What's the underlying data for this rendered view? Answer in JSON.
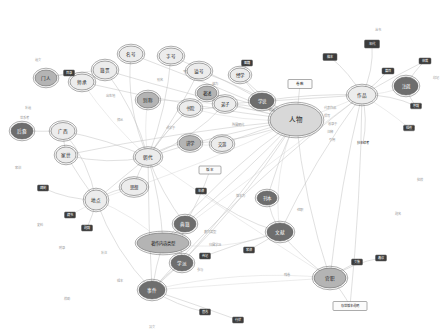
{
  "view": {
    "title": "Knowledge Graph Visualization",
    "background": "#ffffff",
    "width": 448,
    "height": 336,
    "edge_color": "#b9b9b9",
    "node_palette": {
      "hub_light": "#d8d8d8",
      "ellipse_light": "#ececec",
      "ellipse_mid": "#b4b4b4",
      "ellipse_dark": "#6e6e6e",
      "rect_dark": "#3c3c3c",
      "rect_light": "#fbfbfb",
      "stroke": "#5a5a5a",
      "label_dark": "#1e1e1e",
      "label_light": "#ffffff"
    }
  },
  "legend": {
    "graph_kind": "force-directed knowledge graph",
    "node_shapes": [
      "ellipse",
      "rectangle"
    ],
    "hub_count": 6
  },
  "nodes": [
    {
      "id": "n01",
      "label": "人物",
      "x": 296,
      "y": 120,
      "rx": 26,
      "ry": 16,
      "shape": "ellipse",
      "style": "hub_light",
      "fs": 6.5,
      "ring": true
    },
    {
      "id": "n02",
      "label": "作品",
      "x": 362,
      "y": 95,
      "rx": 14,
      "ry": 9,
      "shape": "ellipse",
      "style": "ellipse_light",
      "fs": 4.6,
      "ring": true
    },
    {
      "id": "n03",
      "label": "朝代",
      "x": 148,
      "y": 157,
      "rx": 13,
      "ry": 8.5,
      "shape": "ellipse",
      "style": "ellipse_light",
      "fs": 4.6,
      "ring": true
    },
    {
      "id": "n04",
      "label": "地点",
      "x": 96,
      "y": 200,
      "rx": 11,
      "ry": 10,
      "shape": "ellipse",
      "style": "ellipse_light",
      "fs": 4.6,
      "ring": true
    },
    {
      "id": "n05",
      "label": "事件",
      "x": 152,
      "y": 290,
      "rx": 13,
      "ry": 9,
      "shape": "ellipse",
      "style": "ellipse_dark",
      "fs": 4.6,
      "ring": true
    },
    {
      "id": "n06",
      "label": "官职",
      "x": 330,
      "y": 278,
      "rx": 16,
      "ry": 10,
      "shape": "ellipse",
      "style": "ellipse_mid",
      "fs": 4.6,
      "ring": true
    },
    {
      "id": "n07",
      "label": "文献",
      "x": 280,
      "y": 232,
      "rx": 13,
      "ry": 9,
      "shape": "ellipse",
      "style": "ellipse_dark",
      "fs": 4.6,
      "ring": true
    },
    {
      "id": "n08",
      "label": "典籍",
      "x": 185,
      "y": 224,
      "rx": 11,
      "ry": 8,
      "shape": "ellipse",
      "style": "ellipse_dark",
      "fs": 4.6,
      "ring": true
    },
    {
      "id": "n09",
      "label": "著作内容类型",
      "x": 163,
      "y": 243,
      "rx": 26,
      "ry": 10,
      "shape": "ellipse",
      "style": "ellipse_mid",
      "fs": 4.4,
      "ring": true
    },
    {
      "id": "n10",
      "label": "学派",
      "x": 182,
      "y": 263,
      "rx": 11,
      "ry": 8,
      "shape": "ellipse",
      "style": "ellipse_dark",
      "fs": 4.6,
      "ring": true
    },
    {
      "id": "n11",
      "label": "思想",
      "x": 134,
      "y": 187,
      "rx": 13,
      "ry": 8.5,
      "shape": "ellipse",
      "style": "ellipse_light",
      "fs": 4.4,
      "ring": true
    },
    {
      "id": "n12",
      "label": "籍贯",
      "x": 105,
      "y": 70,
      "rx": 12,
      "ry": 9,
      "shape": "ellipse",
      "style": "ellipse_light",
      "fs": 4.6,
      "ring": true
    },
    {
      "id": "n13",
      "label": "名号",
      "x": 131,
      "y": 54,
      "rx": 12,
      "ry": 8,
      "shape": "ellipse",
      "style": "ellipse_light",
      "fs": 4.6,
      "ring": true
    },
    {
      "id": "n14",
      "label": "字号",
      "x": 171,
      "y": 56,
      "rx": 12,
      "ry": 8,
      "shape": "ellipse",
      "style": "ellipse_light",
      "fs": 4.6,
      "ring": true
    },
    {
      "id": "n15",
      "label": "谥号",
      "x": 199,
      "y": 71,
      "rx": 12,
      "ry": 8,
      "shape": "ellipse",
      "style": "ellipse_light",
      "fs": 4.6,
      "ring": true
    },
    {
      "id": "n16",
      "label": "别称",
      "x": 148,
      "y": 100,
      "rx": 11,
      "ry": 8,
      "shape": "ellipse",
      "style": "ellipse_mid",
      "fs": 4.6,
      "ring": true
    },
    {
      "id": "n17",
      "label": "门人",
      "x": 46,
      "y": 78,
      "rx": 11,
      "ry": 8,
      "shape": "ellipse",
      "style": "ellipse_mid",
      "fs": 4.6,
      "ring": true
    },
    {
      "id": "n18",
      "label": "师承",
      "x": 82,
      "y": 82,
      "rx": 12,
      "ry": 8,
      "shape": "ellipse",
      "style": "ellipse_light",
      "fs": 4.6,
      "ring": true
    },
    {
      "id": "n19",
      "label": "家世",
      "x": 66,
      "y": 155,
      "rx": 10,
      "ry": 8,
      "shape": "ellipse",
      "style": "ellipse_light",
      "fs": 4.6,
      "ring": true
    },
    {
      "id": "n20",
      "label": "广西",
      "x": 63,
      "y": 131,
      "rx": 12,
      "ry": 8.5,
      "shape": "ellipse",
      "style": "ellipse_light",
      "fs": 4.6,
      "ring": true
    },
    {
      "id": "n21",
      "label": "后裔",
      "x": 22,
      "y": 131,
      "rx": 11,
      "ry": 8,
      "shape": "ellipse",
      "style": "ellipse_dark",
      "fs": 4.6,
      "ring": true
    },
    {
      "id": "n22",
      "label": "书院",
      "x": 190,
      "y": 108,
      "rx": 11,
      "ry": 7.5,
      "shape": "ellipse",
      "style": "ellipse_light",
      "fs": 4.4,
      "ring": true
    },
    {
      "id": "n23",
      "label": "讲学",
      "x": 190,
      "y": 143,
      "rx": 11,
      "ry": 7.5,
      "shape": "ellipse",
      "style": "ellipse_mid",
      "fs": 4.4,
      "ring": true
    },
    {
      "id": "n24",
      "label": "弟子",
      "x": 225,
      "y": 104,
      "rx": 11,
      "ry": 7.5,
      "shape": "ellipse",
      "style": "ellipse_light",
      "fs": 4.4,
      "ring": true
    },
    {
      "id": "n25",
      "label": "交游",
      "x": 222,
      "y": 144,
      "rx": 11,
      "ry": 7.5,
      "shape": "ellipse",
      "style": "ellipse_light",
      "fs": 4.4,
      "ring": true
    },
    {
      "id": "n26",
      "label": "学说",
      "x": 262,
      "y": 101,
      "rx": 12,
      "ry": 8,
      "shape": "ellipse",
      "style": "ellipse_dark",
      "fs": 4.4,
      "ring": true
    },
    {
      "id": "n27",
      "label": "著述",
      "x": 207,
      "y": 93,
      "rx": 10,
      "ry": 7,
      "shape": "ellipse",
      "style": "ellipse_mid",
      "fs": 4.4,
      "ring": true
    },
    {
      "id": "n28",
      "label": "经学",
      "x": 240,
      "y": 75,
      "rx": 10,
      "ry": 7,
      "shape": "ellipse",
      "style": "ellipse_light",
      "fs": 4.4,
      "ring": true
    },
    {
      "id": "n29",
      "label": "注疏",
      "x": 406,
      "y": 86,
      "rx": 12,
      "ry": 9,
      "shape": "ellipse",
      "style": "ellipse_dark",
      "fs": 4.4,
      "ring": true
    },
    {
      "id": "n30",
      "label": "刊本",
      "x": 267,
      "y": 198,
      "rx": 10,
      "ry": 7,
      "shape": "ellipse",
      "style": "ellipse_dark",
      "fs": 4.4,
      "ring": true
    },
    {
      "id": "r01",
      "label": "卷数",
      "x": 300,
      "y": 84,
      "w": 24,
      "h": 9,
      "shape": "rect",
      "style": "rect_light",
      "fs": 3.6
    },
    {
      "id": "r02",
      "label": "版本",
      "x": 210,
      "y": 170,
      "w": 22,
      "h": 8,
      "shape": "rect",
      "style": "rect_light",
      "fs": 3.6
    },
    {
      "id": "r03",
      "label": "年代",
      "x": 372,
      "y": 44,
      "w": 15,
      "h": 8,
      "shape": "rect",
      "style": "rect_dark",
      "fs": 3.4
    },
    {
      "id": "r04",
      "label": "篇目",
      "x": 388,
      "y": 71,
      "w": 12,
      "h": 6,
      "shape": "rect",
      "style": "rect_dark",
      "fs": 3.2
    },
    {
      "id": "r05",
      "label": "体裁",
      "x": 425,
      "y": 61,
      "w": 12,
      "h": 6,
      "shape": "rect",
      "style": "rect_dark",
      "fs": 3.2
    },
    {
      "id": "r06",
      "label": "序跋",
      "x": 416,
      "y": 106,
      "w": 11,
      "h": 5.5,
      "shape": "rect",
      "style": "rect_dark",
      "fs": 3.2
    },
    {
      "id": "r07",
      "label": "辑佚",
      "x": 409,
      "y": 128,
      "w": 11,
      "h": 5.5,
      "shape": "rect",
      "style": "rect_dark",
      "fs": 3.2
    },
    {
      "id": "r08",
      "label": "藏书",
      "x": 70,
      "y": 215,
      "w": 11,
      "h": 6,
      "shape": "rect",
      "style": "rect_dark",
      "fs": 3.2
    },
    {
      "id": "r09",
      "label": "碑刻",
      "x": 43,
      "y": 188,
      "w": 11,
      "h": 6,
      "shape": "rect",
      "style": "rect_dark",
      "fs": 3.2
    },
    {
      "id": "r10",
      "label": "题跋",
      "x": 87,
      "y": 228,
      "w": 11,
      "h": 6,
      "shape": "rect",
      "style": "rect_dark",
      "fs": 3.2
    },
    {
      "id": "r11",
      "label": "年谱",
      "x": 201,
      "y": 191,
      "w": 11,
      "h": 6,
      "shape": "rect",
      "style": "rect_dark",
      "fs": 3.2
    },
    {
      "id": "r12",
      "label": "传记",
      "x": 205,
      "y": 256,
      "w": 11,
      "h": 6,
      "shape": "rect",
      "style": "rect_dark",
      "fs": 3.2
    },
    {
      "id": "r13",
      "label": "家谱",
      "x": 249,
      "y": 250,
      "w": 11,
      "h": 6,
      "shape": "rect",
      "style": "rect_dark",
      "fs": 3.2
    },
    {
      "id": "r14",
      "label": "文集",
      "x": 357,
      "y": 262,
      "w": 11,
      "h": 6,
      "shape": "rect",
      "style": "rect_dark",
      "fs": 3.2
    },
    {
      "id": "r15",
      "label": "奏议",
      "x": 381,
      "y": 258,
      "w": 11,
      "h": 6,
      "shape": "rect",
      "style": "rect_dark",
      "fs": 3.2
    },
    {
      "id": "r16",
      "label": "墓志",
      "x": 205,
      "y": 312,
      "w": 11,
      "h": 6,
      "shape": "rect",
      "style": "rect_dark",
      "fs": 3.2
    },
    {
      "id": "r17",
      "label": "行状",
      "x": 238,
      "y": 320,
      "w": 11,
      "h": 6,
      "shape": "rect",
      "style": "rect_dark",
      "fs": 3.2
    },
    {
      "id": "r18",
      "label": "目录",
      "x": 69,
      "y": 73,
      "w": 11,
      "h": 6,
      "shape": "rect",
      "style": "rect_dark",
      "fs": 3.2
    },
    {
      "id": "r19",
      "label": "图籍",
      "x": 247,
      "y": 63,
      "w": 11,
      "h": 6,
      "shape": "rect",
      "style": "rect_dark",
      "fs": 3.2
    },
    {
      "id": "r20",
      "label": "稿本",
      "x": 330,
      "y": 57,
      "w": 14,
      "h": 7,
      "shape": "rect",
      "style": "rect_dark",
      "fs": 3.2
    },
    {
      "id": "r21",
      "label": "抄本续考",
      "x": 363,
      "y": 143,
      "w": 26,
      "h": 6,
      "shape": "rect",
      "style": "rect_none",
      "fs": 3.2
    },
    {
      "id": "r22",
      "label": "存世版本说明",
      "x": 350,
      "y": 306,
      "w": 34,
      "h": 9,
      "shape": "rect",
      "style": "rect_light",
      "fs": 3.2
    }
  ],
  "small_labels": [
    {
      "text": "遗文",
      "x": 38,
      "y": 60,
      "fs": 3.2
    },
    {
      "text": "补遗",
      "x": 28,
      "y": 108,
      "fs": 3.2
    },
    {
      "text": "世系考",
      "x": 24,
      "y": 118,
      "fs": 3.2
    },
    {
      "text": "家训",
      "x": 18,
      "y": 168,
      "fs": 3.2
    },
    {
      "text": "史料",
      "x": 40,
      "y": 225,
      "fs": 3.2
    },
    {
      "text": "附录",
      "x": 62,
      "y": 248,
      "fs": 3.2
    },
    {
      "text": "补注",
      "x": 104,
      "y": 253,
      "fs": 3.2
    },
    {
      "text": "辑本",
      "x": 120,
      "y": 281,
      "fs": 3.2
    },
    {
      "text": "校勘",
      "x": 67,
      "y": 299,
      "fs": 3.2
    },
    {
      "text": "异文",
      "x": 152,
      "y": 327,
      "fs": 3.2
    },
    {
      "text": "残卷",
      "x": 287,
      "y": 275,
      "fs": 3.2
    },
    {
      "text": "批校",
      "x": 420,
      "y": 180,
      "fs": 3.2
    },
    {
      "text": "题名",
      "x": 398,
      "y": 214,
      "fs": 3.2
    },
    {
      "text": "印记",
      "x": 436,
      "y": 78,
      "fs": 3.2
    },
    {
      "text": "丛书",
      "x": 378,
      "y": 30,
      "fs": 3.2
    }
  ],
  "edge_labels": [
    {
      "text": "所属朝代",
      "x": 238,
      "y": 125
    },
    {
      "text": "代表作品",
      "x": 330,
      "y": 108
    },
    {
      "text": "撰写",
      "x": 327,
      "y": 116
    },
    {
      "text": "收录于",
      "x": 332,
      "y": 124
    },
    {
      "text": "注释",
      "x": 330,
      "y": 132
    },
    {
      "text": "引用",
      "x": 332,
      "y": 140
    },
    {
      "text": "师从",
      "x": 120,
      "y": 120
    },
    {
      "text": "讲学于",
      "x": 170,
      "y": 128
    },
    {
      "text": "任职",
      "x": 300,
      "y": 210
    },
    {
      "text": "出生地",
      "x": 110,
      "y": 96
    },
    {
      "text": "参与",
      "x": 200,
      "y": 270
    },
    {
      "text": "版本为",
      "x": 240,
      "y": 196
    },
    {
      "text": "别名",
      "x": 160,
      "y": 80
    },
    {
      "text": "字为",
      "x": 186,
      "y": 72
    },
    {
      "text": "谥为",
      "x": 215,
      "y": 84
    },
    {
      "text": "归属学派",
      "x": 215,
      "y": 245
    },
    {
      "text": "著作类型",
      "x": 210,
      "y": 232
    },
    {
      "text": "提出",
      "x": 272,
      "y": 110
    }
  ],
  "edges": [
    [
      "n01",
      "n02"
    ],
    [
      "n01",
      "n03"
    ],
    [
      "n01",
      "n26"
    ],
    [
      "n01",
      "n24"
    ],
    [
      "n01",
      "n25"
    ],
    [
      "n01",
      "n22"
    ],
    [
      "n01",
      "n23"
    ],
    [
      "n01",
      "n27"
    ],
    [
      "n01",
      "n28"
    ],
    [
      "n01",
      "n06"
    ],
    [
      "n01",
      "n07"
    ],
    [
      "n01",
      "n05"
    ],
    [
      "n01",
      "n09"
    ],
    [
      "n01",
      "n10"
    ],
    [
      "n01",
      "n08"
    ],
    [
      "n01",
      "n04"
    ],
    [
      "n01",
      "n12"
    ],
    [
      "n01",
      "n13"
    ],
    [
      "n01",
      "n14"
    ],
    [
      "n01",
      "n15"
    ],
    [
      "n01",
      "n16"
    ],
    [
      "n01",
      "n18"
    ],
    [
      "n01",
      "n19"
    ],
    [
      "n01",
      "n30"
    ],
    [
      "n01",
      "r01"
    ],
    [
      "n02",
      "n29"
    ],
    [
      "n02",
      "r03"
    ],
    [
      "n02",
      "r04"
    ],
    [
      "n02",
      "r05"
    ],
    [
      "n02",
      "r06"
    ],
    [
      "n02",
      "r07"
    ],
    [
      "n02",
      "r20"
    ],
    [
      "n02",
      "r21"
    ],
    [
      "n02",
      "n06"
    ],
    [
      "n02",
      "n07"
    ],
    [
      "n02",
      "n09"
    ],
    [
      "n02",
      "n26"
    ],
    [
      "n02",
      "n24"
    ],
    [
      "n02",
      "n05"
    ],
    [
      "n02",
      "r22"
    ],
    [
      "n03",
      "n16"
    ],
    [
      "n03",
      "n12"
    ],
    [
      "n03",
      "n13"
    ],
    [
      "n03",
      "n14"
    ],
    [
      "n03",
      "n15"
    ],
    [
      "n03",
      "n18"
    ],
    [
      "n03",
      "n19"
    ],
    [
      "n03",
      "n20"
    ],
    [
      "n03",
      "n11"
    ],
    [
      "n03",
      "n04"
    ],
    [
      "n03",
      "n22"
    ],
    [
      "n03",
      "n23"
    ],
    [
      "n03",
      "n09"
    ],
    [
      "n03",
      "n08"
    ],
    [
      "n03",
      "n05"
    ],
    [
      "n03",
      "n06"
    ],
    [
      "n03",
      "n27"
    ],
    [
      "n03",
      "n24"
    ],
    [
      "n04",
      "n11"
    ],
    [
      "n04",
      "n19"
    ],
    [
      "n04",
      "r08"
    ],
    [
      "n04",
      "r09"
    ],
    [
      "n04",
      "r10"
    ],
    [
      "n04",
      "n20"
    ],
    [
      "n04",
      "n05"
    ],
    [
      "n04",
      "n09"
    ],
    [
      "n05",
      "r16"
    ],
    [
      "n05",
      "r17"
    ],
    [
      "n05",
      "n09"
    ],
    [
      "n05",
      "n10"
    ],
    [
      "n05",
      "n06"
    ],
    [
      "n06",
      "n07"
    ],
    [
      "n06",
      "r14"
    ],
    [
      "n06",
      "r15"
    ],
    [
      "n06",
      "r22"
    ],
    [
      "n06",
      "n05"
    ],
    [
      "n07",
      "n30"
    ],
    [
      "n07",
      "r11"
    ],
    [
      "n07",
      "r12"
    ],
    [
      "n07",
      "r13"
    ],
    [
      "n07",
      "n09"
    ],
    [
      "n08",
      "n09"
    ],
    [
      "n08",
      "n10"
    ],
    [
      "n08",
      "r02"
    ],
    [
      "n12",
      "n18"
    ],
    [
      "n12",
      "n17"
    ],
    [
      "n17",
      "r18"
    ],
    [
      "n20",
      "n21"
    ],
    [
      "n20",
      "n19"
    ],
    [
      "n22",
      "n24"
    ],
    [
      "n23",
      "n25"
    ],
    [
      "n26",
      "n28"
    ],
    [
      "n28",
      "r19"
    ],
    [
      "n29",
      "r05"
    ],
    [
      "n29",
      "r06"
    ]
  ]
}
